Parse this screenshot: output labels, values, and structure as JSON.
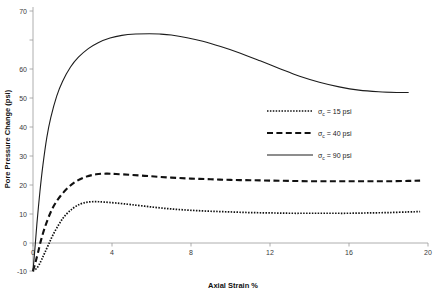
{
  "chart_data": {
    "type": "line",
    "title": "",
    "xlabel": "Axial Strain %",
    "ylabel": "Pore Pressure Change (psi)",
    "xlim": [
      0,
      20
    ],
    "ylim": [
      -10,
      70
    ],
    "xticks": [
      "0",
      "4",
      "8",
      "12",
      "16",
      "20"
    ],
    "xtick_values": [
      0,
      4,
      8,
      12,
      16,
      20
    ],
    "yticks": [
      "-10",
      "0",
      "10",
      "20",
      "30",
      "40",
      "50",
      "60",
      "70"
    ],
    "ytick_values": [
      -10,
      0,
      10,
      20,
      30,
      40,
      50,
      60,
      70
    ],
    "grid": false,
    "legend_position": "center-right",
    "series": [
      {
        "name": "σc = 15 psi",
        "symbol": "σ",
        "subscript": "c",
        "value_text": "= 15 psi",
        "style": "dotted",
        "x": [
          0,
          0.15,
          0.3,
          0.45,
          0.6,
          0.8,
          1.0,
          1.3,
          1.6,
          2.0,
          2.4,
          2.8,
          3.2,
          3.6,
          4.2,
          5.0,
          6.0,
          7.0,
          8.0,
          9.0,
          10.0,
          11.0,
          12.0,
          13.0,
          14.0,
          15.0,
          16.0,
          17.0,
          18.0,
          19.0,
          19.6
        ],
        "y": [
          -10.0,
          -9.4,
          -8.2,
          -6.4,
          -4.4,
          -1.8,
          0.8,
          4.0,
          6.6,
          8.9,
          10.3,
          10.9,
          11.0,
          10.9,
          10.6,
          10.1,
          9.4,
          8.8,
          8.4,
          8.1,
          7.9,
          7.7,
          7.6,
          7.5,
          7.5,
          7.5,
          7.5,
          7.6,
          7.7,
          7.9,
          8.0
        ]
      },
      {
        "name": "σc = 40 psi",
        "symbol": "σ",
        "subscript": "c",
        "value_text": "= 40 psi",
        "style": "dashed",
        "x": [
          0,
          0.12,
          0.25,
          0.4,
          0.6,
          0.85,
          1.1,
          1.4,
          1.8,
          2.2,
          2.7,
          3.2,
          3.7,
          4.2,
          5.0,
          6.0,
          7.0,
          8.0,
          9.0,
          10.0,
          11.0,
          12.0,
          13.0,
          14.0,
          15.0,
          16.0,
          17.0,
          18.0,
          19.0,
          19.6
        ],
        "y": [
          -10.0,
          -7.5,
          -4.5,
          -0.8,
          3.2,
          7.2,
          10.2,
          12.8,
          15.4,
          17.2,
          18.6,
          19.3,
          19.5,
          19.4,
          19.1,
          18.7,
          18.3,
          18.0,
          17.8,
          17.6,
          17.5,
          17.4,
          17.3,
          17.2,
          17.2,
          17.2,
          17.2,
          17.2,
          17.3,
          17.4
        ]
      },
      {
        "name": "σc = 90 psi",
        "symbol": "σ",
        "subscript": "c",
        "value_text": "= 90 psi",
        "style": "solid",
        "x": [
          0,
          0.1,
          0.2,
          0.35,
          0.5,
          0.7,
          0.9,
          1.2,
          1.5,
          1.9,
          2.3,
          2.8,
          3.3,
          3.9,
          4.5,
          5.2,
          5.9,
          6.4,
          7.0,
          7.8,
          8.6,
          9.5,
          10.5,
          11.5,
          12.5,
          13.5,
          14.5,
          15.5,
          16.5,
          17.5,
          18.4,
          19.0
        ],
        "y": [
          -10.0,
          -3.0,
          4.5,
          14.0,
          22.0,
          30.5,
          36.5,
          43.0,
          47.5,
          51.8,
          54.8,
          57.4,
          59.2,
          60.6,
          61.4,
          61.8,
          61.9,
          61.8,
          61.5,
          60.7,
          59.6,
          58.0,
          56.0,
          53.7,
          51.3,
          49.0,
          47.2,
          45.8,
          44.8,
          44.3,
          44.1,
          44.1
        ]
      }
    ]
  },
  "legend": {
    "entries": [
      {
        "sigma": "σ",
        "sub": "c",
        "rest": "= 15 psi"
      },
      {
        "sigma": "σ",
        "sub": "c",
        "rest": "= 40 psi"
      },
      {
        "sigma": "σ",
        "sub": "c",
        "rest": "= 90 psi"
      }
    ]
  },
  "colors": {
    "line": "#111111",
    "axis": "#9a9a9a",
    "background": "#ffffff",
    "text": "#1a1a1a"
  }
}
